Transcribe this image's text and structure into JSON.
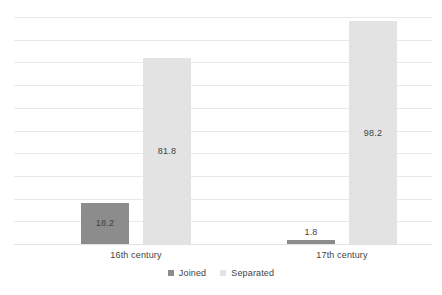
{
  "chart_data": {
    "type": "bar",
    "title": "",
    "subtitle": "",
    "xlabel": "",
    "ylabel": "",
    "categories": [
      "16th century",
      "17th century"
    ],
    "series": [
      {
        "name": "Joined",
        "color": "#8c8c8c",
        "values": [
          18.2,
          1.8
        ],
        "labels": [
          "18.2",
          "1.8"
        ]
      },
      {
        "name": "Separated",
        "color": "#e3e3e3",
        "values": [
          81.8,
          98.2
        ],
        "labels": [
          "81.8",
          "98.2"
        ]
      }
    ],
    "ylim": [
      0,
      100
    ],
    "grid": true,
    "gridline_count": 10,
    "legend_position": "bottom",
    "axis_labels_visible": false,
    "value_labels_visible": true
  },
  "legend": {
    "items": [
      {
        "label": "Joined",
        "swatch": "square-swatch-joined"
      },
      {
        "label": "Separated",
        "swatch": "square-swatch-separated"
      }
    ]
  },
  "colors": {
    "background": "#ffffff",
    "gridline": "#e9e9e9",
    "text": "#3f3f3f",
    "series_joined": "#8c8c8c",
    "series_separated": "#e3e3e3"
  }
}
